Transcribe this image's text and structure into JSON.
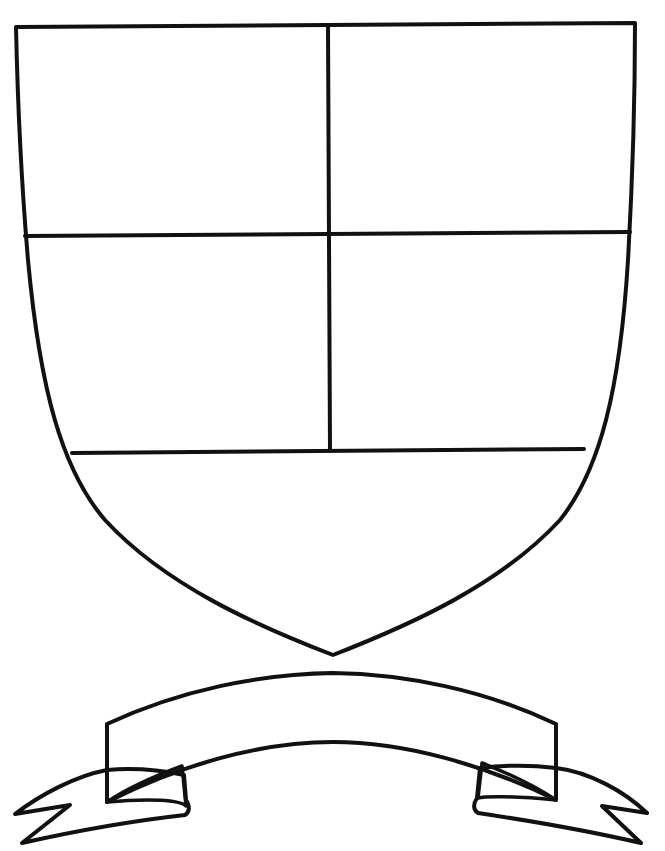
{
  "illustration": {
    "kind": "coat-of-arms template",
    "background": "#ffffff",
    "line_color": "#111111",
    "shield": {
      "fill": "#ffffff",
      "stroke_width": 4,
      "divisions": {
        "vertical_divider_x": 329,
        "upper_horizontal_y": 235,
        "lower_horizontal_y": 450,
        "sections": [
          "top-left quarter",
          "top-right quarter",
          "middle-left quarter",
          "middle-right quarter",
          "base"
        ]
      }
    },
    "banner": {
      "label_text": "",
      "band_gradient": [
        "#8e8e8e",
        "#b9b9b9",
        "#f4f4f4",
        "#bdbdbd",
        "#8a8a8a"
      ],
      "tail_fill": "#a9a9a9",
      "fold_fill": "#6f6f6f",
      "stroke_width": 4
    }
  }
}
